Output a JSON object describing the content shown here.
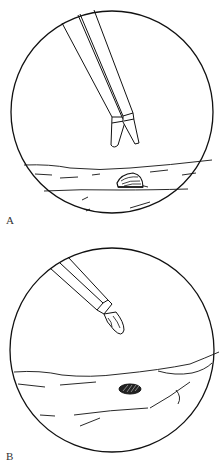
{
  "figure": {
    "panels": [
      {
        "label": "A",
        "view": "circular-field",
        "elements": [
          "forceps-open",
          "tissue-surface",
          "raised-foreign-body"
        ]
      },
      {
        "label": "B",
        "view": "circular-field",
        "elements": [
          "forceps-grasping-object",
          "tissue-surface",
          "hatched-defect"
        ]
      }
    ]
  },
  "colors": {
    "line": "#111111",
    "background": "#ffffff",
    "label": "#333333"
  }
}
